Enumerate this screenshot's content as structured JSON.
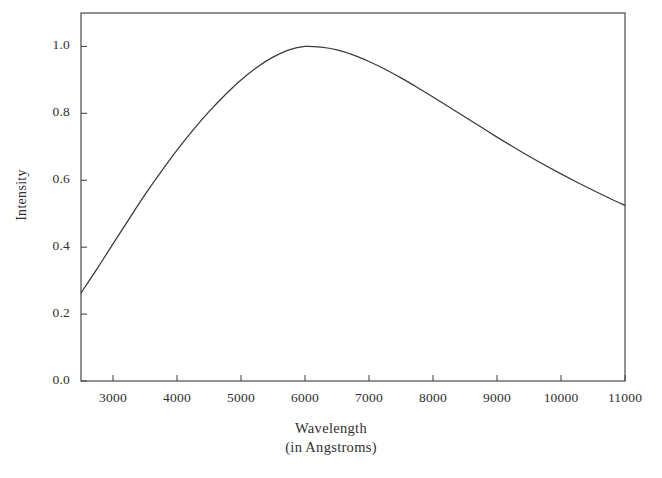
{
  "figure": {
    "background_color": "#ffffff",
    "axis_color": "#4a4a4a",
    "curve_color": "#3a3a3a",
    "text_color": "#2f2f2f"
  },
  "chart_data": {
    "type": "line",
    "title": "",
    "subtitle": "",
    "xlabel": "Wavelength",
    "xlabel_line2": "(in Angstroms)",
    "ylabel": "Intensity",
    "xlim": [
      2500,
      11000
    ],
    "ylim": [
      0.0,
      1.1
    ],
    "grid": false,
    "legend": false,
    "legend_position": "none",
    "xticks": [
      3000,
      4000,
      5000,
      6000,
      7000,
      8000,
      9000,
      10000,
      11000
    ],
    "xtick_labels": [
      "3000",
      "4000",
      "5000",
      "6000",
      "7000",
      "8000",
      "9000",
      "10000",
      "11000"
    ],
    "yticks": [
      0.0,
      0.2,
      0.4,
      0.6,
      0.8,
      1.0
    ],
    "ytick_labels": [
      "0.0",
      "0.2",
      "0.4",
      "0.6",
      "0.8",
      "1.0"
    ],
    "series": [
      {
        "name": "Intensity",
        "x": [
          2500,
          2750,
          3000,
          3250,
          3500,
          3750,
          4000,
          4250,
          4500,
          4750,
          5000,
          5250,
          5500,
          5750,
          6000,
          6250,
          6500,
          6750,
          7000,
          7250,
          7500,
          7750,
          8000,
          8250,
          8500,
          8750,
          9000,
          9250,
          9500,
          9750,
          10000,
          10250,
          10500,
          10750,
          11000
        ],
        "values": [
          0.263,
          0.335,
          0.41,
          0.484,
          0.557,
          0.625,
          0.69,
          0.75,
          0.805,
          0.855,
          0.9,
          0.938,
          0.968,
          0.99,
          1.0,
          0.998,
          0.99,
          0.975,
          0.955,
          0.932,
          0.906,
          0.878,
          0.849,
          0.819,
          0.789,
          0.759,
          0.729,
          0.7,
          0.672,
          0.645,
          0.619,
          0.594,
          0.57,
          0.547,
          0.525
        ]
      }
    ]
  },
  "axes": {
    "frame": {
      "left_px": 81,
      "right_px": 625,
      "top_px": 13,
      "bottom_px": 381
    }
  }
}
